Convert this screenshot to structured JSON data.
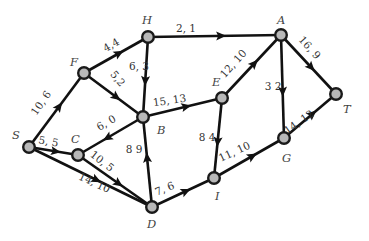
{
  "diagram": {
    "type": "network-flow-graph",
    "colors": {
      "node_fill": "#b8b8b8",
      "node_stroke": "#1a1a1a",
      "edge": "#111111",
      "text": "#333333"
    },
    "nodes": [
      {
        "id": "S",
        "label": "S",
        "x": 29,
        "y": 147,
        "lx": 12,
        "ly": 139
      },
      {
        "id": "C",
        "label": "C",
        "x": 78,
        "y": 155,
        "lx": 71,
        "ly": 143
      },
      {
        "id": "F",
        "label": "F",
        "x": 84,
        "y": 73,
        "lx": 70,
        "ly": 66
      },
      {
        "id": "H",
        "label": "H",
        "x": 148,
        "y": 37,
        "lx": 142,
        "ly": 24
      },
      {
        "id": "B",
        "label": "B",
        "x": 143,
        "y": 117,
        "lx": 157,
        "ly": 134
      },
      {
        "id": "E",
        "label": "E",
        "x": 222,
        "y": 98,
        "lx": 212,
        "ly": 86
      },
      {
        "id": "A",
        "label": "A",
        "x": 281,
        "y": 35,
        "lx": 277,
        "ly": 24
      },
      {
        "id": "T",
        "label": "T",
        "x": 336,
        "y": 94,
        "lx": 343,
        "ly": 113
      },
      {
        "id": "G",
        "label": "G",
        "x": 284,
        "y": 138,
        "lx": 282,
        "ly": 162
      },
      {
        "id": "I",
        "label": "I",
        "x": 214,
        "y": 178,
        "lx": 215,
        "ly": 200
      },
      {
        "id": "D",
        "label": "D",
        "x": 152,
        "y": 207,
        "lx": 147,
        "ly": 228
      }
    ],
    "edges": [
      {
        "from": "S",
        "to": "F",
        "label": "10, 6",
        "lx": 44,
        "ly": 105,
        "rot": -55
      },
      {
        "from": "F",
        "to": "H",
        "label": "4,4",
        "lx": 113,
        "ly": 48,
        "rot": -30
      },
      {
        "from": "F",
        "to": "B",
        "label": "5,2",
        "lx": 115,
        "ly": 81,
        "rot": 50
      },
      {
        "from": "H",
        "to": "B",
        "label": "6, 3",
        "lx": 139,
        "ly": 70,
        "rot": 0
      },
      {
        "from": "H",
        "to": "A",
        "label": "2, 1",
        "lx": 186,
        "ly": 32,
        "rot": 0
      },
      {
        "from": "B",
        "to": "E",
        "label": "15, 13",
        "lx": 170,
        "ly": 104,
        "rot": -8
      },
      {
        "from": "B",
        "to": "C",
        "label": "6, 0",
        "lx": 108,
        "ly": 126,
        "rot": -30
      },
      {
        "from": "E",
        "to": "A",
        "label": "12, 10",
        "lx": 236,
        "ly": 66,
        "rot": -48
      },
      {
        "from": "E",
        "to": "I",
        "label": "8   4",
        "lx": 207,
        "ly": 141,
        "rot": 0
      },
      {
        "from": "A",
        "to": "G",
        "label": "3   2",
        "lx": 273,
        "ly": 90,
        "rot": 0
      },
      {
        "from": "A",
        "to": "T",
        "label": "16, 9",
        "lx": 307,
        "ly": 50,
        "rot": 48
      },
      {
        "from": "G",
        "to": "T",
        "label": "14, 12",
        "lx": 301,
        "ly": 125,
        "rot": -35
      },
      {
        "from": "I",
        "to": "G",
        "label": "11, 10",
        "lx": 236,
        "ly": 155,
        "rot": -25
      },
      {
        "from": "D",
        "to": "I",
        "label": "7, 6",
        "lx": 166,
        "ly": 192,
        "rot": -22
      },
      {
        "from": "D",
        "to": "B",
        "label": "8  9",
        "lx": 134,
        "ly": 153,
        "rot": 0
      },
      {
        "from": "S",
        "to": "C",
        "label": "5, 5",
        "lx": 48,
        "ly": 145,
        "rot": 10
      },
      {
        "from": "C",
        "to": "D",
        "label": "10, 5",
        "lx": 100,
        "ly": 164,
        "rot": 38
      },
      {
        "from": "S",
        "to": "D",
        "label": "14, 10",
        "lx": 93,
        "ly": 186,
        "rot": 25
      }
    ]
  }
}
